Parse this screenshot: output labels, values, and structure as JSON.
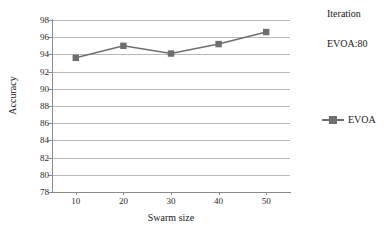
{
  "chart_data": {
    "type": "line",
    "title": "",
    "xlabel": "Swarm size",
    "ylabel": "Accuracy",
    "categories": [
      "10",
      "20",
      "30",
      "40",
      "50"
    ],
    "x": [
      10,
      20,
      30,
      40,
      50
    ],
    "series": [
      {
        "name": "EVOA",
        "values": [
          93.6,
          95.0,
          94.1,
          95.2,
          96.6
        ],
        "color": "#6e6e6e",
        "marker": "square"
      }
    ],
    "ylim": [
      78,
      98
    ],
    "ytick_step": 2,
    "yticks": [
      "98",
      "96",
      "94",
      "92",
      "90",
      "88",
      "86",
      "84",
      "82",
      "80",
      "78"
    ],
    "grid": true,
    "grid_color": "#b8b8b8",
    "legend_position": "right",
    "legend_entries": [
      "EVOA"
    ],
    "annotations": [
      {
        "text": "Iteration",
        "position": "top-right"
      },
      {
        "text": "EVOA:80",
        "position": "right"
      }
    ]
  },
  "axes": {
    "y_title": "Accuracy",
    "x_title": "Swarm size"
  },
  "annotations": {
    "iteration": "Iteration",
    "evoa_iterations": "EVOA:80"
  },
  "legend": {
    "entries": [
      {
        "label": "EVOA",
        "color": "#6e6e6e"
      }
    ]
  }
}
